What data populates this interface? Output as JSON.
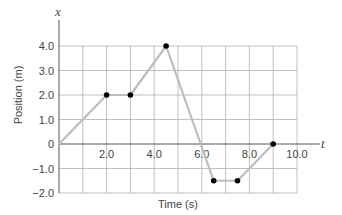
{
  "chart_data": {
    "type": "line",
    "title": "",
    "xlabel": "Time (s)",
    "ylabel": "Position (m)",
    "x_axis_variable": "t",
    "y_axis_variable": "x",
    "xlim": [
      0,
      10
    ],
    "ylim": [
      -2,
      4
    ],
    "grid": true,
    "x_ticks": [
      2,
      4,
      6,
      8,
      10
    ],
    "x_tick_labels": [
      "2.0",
      "4.0",
      "6.0",
      "8.0",
      "10.0"
    ],
    "y_ticks": [
      4,
      3,
      2,
      1,
      0,
      -1,
      -2
    ],
    "y_tick_labels": [
      "4.0",
      "3.0",
      "2.0",
      "1.0",
      "0",
      "-1.0",
      "-2.0"
    ],
    "series": [
      {
        "name": "position",
        "x": [
          0,
          2,
          3,
          4.5,
          6.5,
          7.5,
          9
        ],
        "y": [
          0,
          2,
          2,
          4,
          -1.5,
          -1.5,
          0
        ],
        "markers": [
          false,
          true,
          true,
          true,
          true,
          true,
          true
        ],
        "line_color": "#bdbdbd",
        "marker_color": "#000000"
      }
    ]
  },
  "colors": {
    "grid": "#b0b0b0",
    "axis": "#555555",
    "line": "#bdbdbd",
    "marker": "#000000",
    "text": "#444444"
  }
}
